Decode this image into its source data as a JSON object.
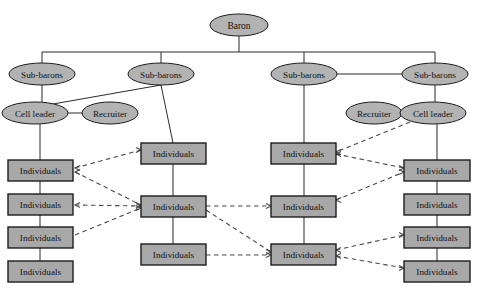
{
  "diagram": {
    "type": "organizational-hierarchy-network",
    "background_color": "#ffffff",
    "node_fill_color": "#b3b3b3",
    "box_fill_color": "#a8a8a8",
    "stroke_color": "#1d1d1d",
    "solid_link_color": "#2b2b2b",
    "dashed_link_color": "#4a4a4a",
    "labels": {
      "baron": "Baron",
      "sub_barons": "Sub-barons",
      "cell_leader": "Cell leader",
      "recruiter": "Recruiter",
      "individuals": "Individuals"
    },
    "nodes": [
      {
        "id": "baron",
        "label": "Baron",
        "shape": "ellipse",
        "cx": 239,
        "cy": 25,
        "rx": 29,
        "ry": 11
      },
      {
        "id": "sub1",
        "label": "Sub-barons",
        "shape": "ellipse",
        "cx": 42,
        "cy": 74,
        "rx": 33,
        "ry": 11
      },
      {
        "id": "sub2",
        "label": "Sub-barons",
        "shape": "ellipse",
        "cx": 161,
        "cy": 74,
        "rx": 33,
        "ry": 11
      },
      {
        "id": "sub3",
        "label": "Sub-barons",
        "shape": "ellipse",
        "cx": 304,
        "cy": 74,
        "rx": 33,
        "ry": 11
      },
      {
        "id": "sub4",
        "label": "Sub-barons",
        "shape": "ellipse",
        "cx": 435,
        "cy": 74,
        "rx": 33,
        "ry": 11
      },
      {
        "id": "cell-left",
        "label": "Cell leader",
        "shape": "ellipse",
        "cx": 35,
        "cy": 113,
        "rx": 33,
        "ry": 11
      },
      {
        "id": "recr-left",
        "label": "Recruiter",
        "shape": "ellipse",
        "cx": 110,
        "cy": 113,
        "rx": 28,
        "ry": 11
      },
      {
        "id": "recr-right",
        "label": "Recruiter",
        "shape": "ellipse",
        "cx": 374,
        "cy": 113,
        "rx": 28,
        "ry": 11
      },
      {
        "id": "cell-right",
        "label": "Cell leader",
        "shape": "ellipse",
        "cx": 433,
        "cy": 113,
        "rx": 33,
        "ry": 11
      },
      {
        "id": "c1r1",
        "label": "Individuals",
        "shape": "box",
        "x": 8,
        "y": 160,
        "w": 65,
        "h": 21
      },
      {
        "id": "c1r2",
        "label": "Individuals",
        "shape": "box",
        "x": 8,
        "y": 194,
        "w": 65,
        "h": 21
      },
      {
        "id": "c1r3",
        "label": "Individuals",
        "shape": "box",
        "x": 8,
        "y": 227,
        "w": 65,
        "h": 21
      },
      {
        "id": "c1r4",
        "label": "Individuals",
        "shape": "box",
        "x": 8,
        "y": 261,
        "w": 65,
        "h": 21
      },
      {
        "id": "c2r1",
        "label": "Individuals",
        "shape": "box",
        "x": 141,
        "y": 143,
        "w": 65,
        "h": 21
      },
      {
        "id": "c2r2",
        "label": "Individuals",
        "shape": "box",
        "x": 141,
        "y": 196,
        "w": 65,
        "h": 21
      },
      {
        "id": "c2r3",
        "label": "Individuals",
        "shape": "box",
        "x": 141,
        "y": 244,
        "w": 65,
        "h": 21
      },
      {
        "id": "c3r1",
        "label": "Individuals",
        "shape": "box",
        "x": 271,
        "y": 143,
        "w": 65,
        "h": 21
      },
      {
        "id": "c3r2",
        "label": "Individuals",
        "shape": "box",
        "x": 271,
        "y": 196,
        "w": 65,
        "h": 21
      },
      {
        "id": "c3r3",
        "label": "Individuals",
        "shape": "box",
        "x": 271,
        "y": 244,
        "w": 65,
        "h": 21
      },
      {
        "id": "c4r1",
        "label": "Individuals",
        "shape": "box",
        "x": 404,
        "y": 160,
        "w": 66,
        "h": 21
      },
      {
        "id": "c4r2",
        "label": "Individuals",
        "shape": "box",
        "x": 404,
        "y": 194,
        "w": 66,
        "h": 21
      },
      {
        "id": "c4r3",
        "label": "Individuals",
        "shape": "box",
        "x": 404,
        "y": 227,
        "w": 66,
        "h": 21
      },
      {
        "id": "c4r4",
        "label": "Individuals",
        "shape": "box",
        "x": 404,
        "y": 261,
        "w": 66,
        "h": 21
      }
    ],
    "solid_edges": [
      {
        "from": "baron",
        "to": "bus",
        "points": "239,36 239,52"
      },
      {
        "from": "bus",
        "to": "bus-span",
        "points": "42,52 435,52"
      },
      {
        "from": "bus",
        "to": "sub1",
        "points": "42,52 42,63"
      },
      {
        "from": "bus",
        "to": "sub2",
        "points": "161,52 161,63"
      },
      {
        "from": "bus",
        "to": "sub3",
        "points": "304,52 304,63"
      },
      {
        "from": "bus",
        "to": "sub4",
        "points": "435,52 435,63"
      },
      {
        "from": "sub3",
        "to": "sub4",
        "points": "337,74 402,74"
      },
      {
        "from": "sub1",
        "to": "cell-left",
        "points": "42,85 42,102"
      },
      {
        "from": "sub2",
        "to": "cell-left",
        "points": "161,85 36,107"
      },
      {
        "from": "cell-left",
        "to": "recr-left",
        "points": "68,113 82,113"
      },
      {
        "from": "cell-left",
        "to": "c1r1",
        "points": "40,124 40,160"
      },
      {
        "from": "sub2",
        "to": "c2r1",
        "points": "161,85 173,143"
      },
      {
        "from": "sub3",
        "to": "c3r1",
        "points": "304,85 304,143"
      },
      {
        "from": "recr-right",
        "to": "cell-right",
        "points": "402,113 400,113"
      },
      {
        "from": "sub4",
        "to": "cell-right",
        "points": "435,85 435,102"
      },
      {
        "from": "cell-right",
        "to": "c4r1",
        "points": "437,124 437,160"
      },
      {
        "from": "c1r1",
        "to": "c1r2",
        "points": "40,181 40,194"
      },
      {
        "from": "c1r2",
        "to": "c1r3",
        "points": "40,215 40,227"
      },
      {
        "from": "c1r3",
        "to": "c1r4",
        "points": "40,248 40,261"
      },
      {
        "from": "c2r1",
        "to": "c2r2",
        "points": "173,164 173,196"
      },
      {
        "from": "c2r2",
        "to": "c2r3",
        "points": "173,217 173,244"
      },
      {
        "from": "c3r1",
        "to": "c3r2",
        "points": "304,164 304,196"
      },
      {
        "from": "c3r2",
        "to": "c3r3",
        "points": "304,217 304,244"
      },
      {
        "from": "c4r1",
        "to": "c4r2",
        "points": "437,181 437,194"
      },
      {
        "from": "c4r2",
        "to": "c4r3",
        "points": "437,215 437,227"
      },
      {
        "from": "c4r3",
        "to": "c4r4",
        "points": "437,248 437,261"
      }
    ],
    "dashed_edges": [
      {
        "from": "c1r1",
        "to": "c2r1",
        "points": "75,168 141,150"
      },
      {
        "from": "c1r1",
        "to": "c2r2",
        "points": "75,172 141,205"
      },
      {
        "from": "c1r2",
        "to": "c2r2",
        "points": "75,205 141,206"
      },
      {
        "from": "c1r3",
        "to": "c2r2",
        "points": "75,235 141,208"
      },
      {
        "from": "c2r2",
        "to": "c3r2",
        "points": "206,206 271,206"
      },
      {
        "from": "c2r2",
        "to": "c3r3",
        "points": "206,210 271,252"
      },
      {
        "from": "c2r3",
        "to": "c3r3",
        "points": "206,255 271,255"
      },
      {
        "from": "cell-right",
        "to": "c3r1",
        "points": "410,122 336,152"
      },
      {
        "from": "c3r1",
        "to": "c4r1",
        "points": "336,154 404,168"
      },
      {
        "from": "c3r2",
        "to": "c4r1",
        "points": "336,200 404,172"
      },
      {
        "from": "c3r3",
        "to": "c4r3",
        "points": "336,250 404,235"
      },
      {
        "from": "c3r3",
        "to": "c4r4",
        "points": "336,256 404,268"
      }
    ]
  }
}
